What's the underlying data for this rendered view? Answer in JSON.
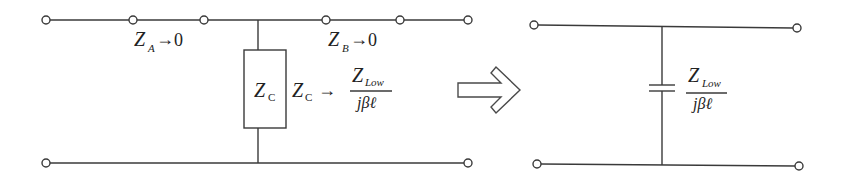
{
  "diagram": {
    "type": "circuit-equivalence",
    "left_circuit": {
      "series_a": {
        "symbol": "Z",
        "sub": "A",
        "arrow": "→",
        "limit": "0"
      },
      "series_b": {
        "symbol": "Z",
        "sub": "B",
        "arrow": "→",
        "limit": "0"
      },
      "shunt": {
        "box_symbol": "Z",
        "box_sub": "C",
        "label_symbol": "Z",
        "label_sub": "C",
        "arrow": "→",
        "fraction_num": "Z",
        "fraction_num_sub": "Low",
        "fraction_den": "jβℓ"
      }
    },
    "transform_arrow": "⇨",
    "right_circuit": {
      "element": "capacitor",
      "fraction_num": "Z",
      "fraction_num_sub": "Low",
      "fraction_den": "jβℓ"
    },
    "colors": {
      "line": "#3a3a3a",
      "background": "#ffffff"
    }
  }
}
